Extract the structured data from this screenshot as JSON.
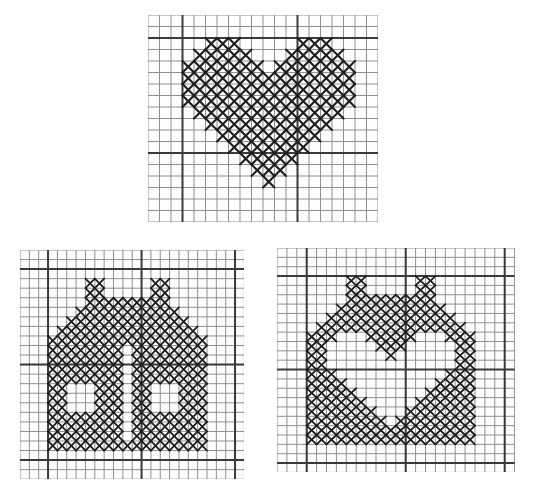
{
  "page": {
    "background_color": "#ffffff",
    "paper_color": "#fefefe"
  },
  "charts": [
    {
      "id": "heart-chart",
      "label": "heart cross-stitch chart",
      "x": 148,
      "y": 15,
      "cols": 20,
      "rows": 18,
      "cell_w": 11.5,
      "cell_h": 11.5,
      "bold_cols": [
        3,
        13
      ],
      "bold_rows": [
        2,
        12
      ],
      "grid_color": "#8f8f8f",
      "bold_color": "#3a3a3a",
      "stitch_color": "#1e1e1e",
      "grid_width": 1,
      "bold_width": 2,
      "stitch_width": 2.1,
      "pattern": [
        "....................",
        "....................",
        ".....XXX.....XXX....",
        "....XXXXX...XXXXX...",
        "...XXXXXXX.XXXXXXX..",
        "...XXXXXXXXXXXXXXX..",
        "...XXXXXXXXXXXXXXX..",
        "...XXXXXXXXXXXXXXX..",
        "....XXXXXXXXXXXXX...",
        ".....XXXXXXXXXXX....",
        "......XXXXXXXXX.....",
        ".......XXXXXXX......",
        "........XXXXX.......",
        ".........XXX........",
        "..........X.........",
        "....................",
        "....................",
        "...................."
      ]
    },
    {
      "id": "house-chart",
      "label": "house cross-stitch chart",
      "x": 20,
      "y": 250,
      "cols": 24,
      "rows": 24,
      "cell_w": 9.35,
      "cell_h": 9.55,
      "bold_cols": [
        3,
        13,
        23
      ],
      "bold_rows": [
        2,
        12,
        22
      ],
      "grid_color": "#8f8f8f",
      "bold_color": "#3a3a3a",
      "stitch_color": "#1e1e1e",
      "grid_width": 1,
      "bold_width": 2,
      "stitch_width": 1.8,
      "pattern": [
        "........................",
        "........................",
        "........................",
        ".......XX.....XX........",
        ".......XX.....XX........",
        ".......XXXXXXXXX........",
        "......XXXXXXXXXXX.......",
        ".....XXXXXXXXXXXXX......",
        "....XXXXXXXXXXXXXXX.....",
        "...XXXXXXXXXXXXXXXXX....",
        "...XXXXXXXX.XXXXXXXX....",
        "...XXXXXXXX.XXXXXXXX....",
        "...XXXXXXXX.XXXXXXXX....",
        "...XXXXXXXX.XXXXXXXX....",
        "...XX...XXX.XX...XXX....",
        "...XX...XXX.XX...XXX....",
        "...XX...XXX.XX...XXX....",
        "...XXXXXXXX.XXXXXXXX....",
        "...XXXXXXXX.XXXXXXXX....",
        "...XXXXXXXX.XXXXXXXX....",
        "...XXXXXXXXXXXXXXXXX....",
        "........................",
        "........................",
        "........................"
      ]
    },
    {
      "id": "house-heart-chart",
      "label": "house with heart cutout cross-stitch chart",
      "x": 277,
      "y": 248,
      "cols": 24,
      "rows": 24,
      "cell_w": 9.9,
      "cell_h": 9.35,
      "bold_cols": [
        3,
        13,
        23
      ],
      "bold_rows": [
        3,
        13,
        23
      ],
      "grid_color": "#8f8f8f",
      "bold_color": "#3a3a3a",
      "stitch_color": "#1e1e1e",
      "grid_width": 1,
      "bold_width": 2,
      "stitch_width": 1.8,
      "pattern": [
        "........................",
        "........................",
        "........................",
        ".......XX.....XX........",
        ".......XX.....XX........",
        ".......XXXXXXXXX........",
        "......XXXXXXXXXXX.......",
        ".....XXXXXXXXXXXXX......",
        "....XXXXXXXXXXXXXXX.....",
        "...XXX...XXXXX...XXX....",
        "...XX.....XXX.....XX....",
        "...XX......X......XX....",
        "...XX.............XX....",
        "...XXX...........XXX....",
        "...XXXX.........XXXX....",
        "...XXXXX.......XXXXX....",
        "...XXXXXX.....XXXXXX....",
        "...XXXXXXX...XXXXXXX....",
        "...XXXXXXXX.XXXXXXXX....",
        "...XXXXXXXXXXXXXXXXX....",
        "...XXXXXXXXXXXXXXXXX....",
        "........................",
        "........................",
        "........................"
      ]
    }
  ]
}
